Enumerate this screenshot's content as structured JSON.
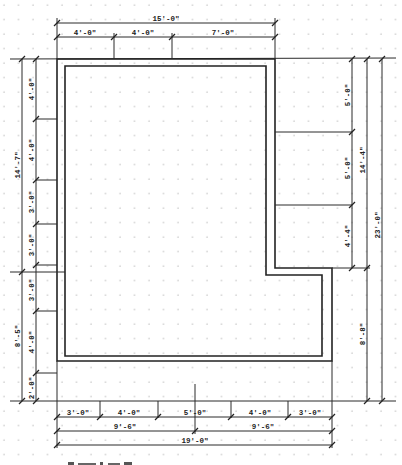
{
  "drawing": {
    "type": "floor plan dimension drawing",
    "grid": "dotted"
  },
  "top_dimensions": {
    "overall": "15'-0\"",
    "segments": [
      "4'-0\"",
      "4'-0\"",
      "7'-0\""
    ]
  },
  "left_dimensions": {
    "overall_upper": "14'-7\"",
    "overall_lower": "8'-5\"",
    "segments": [
      "4'-0\"",
      "4'-0\"",
      "3'-0\"",
      "3'-0\"",
      "3'-0\"",
      "4'-0\"",
      "2'-0\""
    ]
  },
  "right_dimensions": {
    "segments": [
      "5'-0\"",
      "5'-0\"",
      "4'-4\""
    ],
    "upper_total": "14'-4\"",
    "lower_total": "8'-8\"",
    "overall": "23'-0\""
  },
  "bottom_dimensions": {
    "segments": [
      "3'-0\"",
      "4'-0\"",
      "5'-0\"",
      "4'-0\"",
      "3'-0\""
    ],
    "halves": [
      "9'-6\"",
      "9'-6\""
    ],
    "overall": "19'-0\""
  }
}
